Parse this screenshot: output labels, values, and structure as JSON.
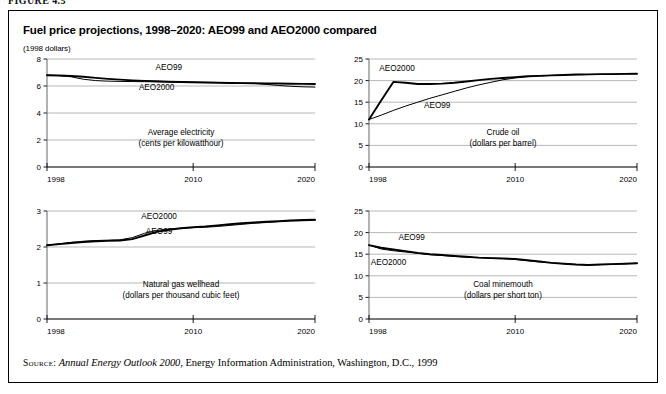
{
  "figure": {
    "label": "FIGURE 4.5"
  },
  "panel": {
    "title": "Fuel price projections, 1998–2020: AEO99 and AEO2000 compared",
    "units": "(1998 dollars)"
  },
  "source": {
    "kicker": "Source:",
    "italic_part": "Annual Energy Outlook 2000",
    "rest": ", Energy Information Administration, Washington, D.C., 1999"
  },
  "series_names": {
    "aeo99": "AEO99",
    "aeo2000": "AEO2000"
  },
  "chart_data": [
    {
      "id": "electricity",
      "type": "line",
      "title": "Average electricity",
      "subtitle": "(cents per kilowatthour)",
      "xlabel": "",
      "ylabel": "",
      "xlim": [
        1998,
        2020
      ],
      "ylim": [
        0,
        8
      ],
      "yticks": [
        0,
        2,
        4,
        6,
        8
      ],
      "xticks": [
        1998,
        2010,
        2020
      ],
      "xtick_labels": [
        "1998",
        "2010",
        "2020"
      ],
      "ytick_labels": [
        "0",
        "2",
        "4",
        "6",
        "8"
      ],
      "grid": true,
      "legend": "inline-labels",
      "x": [
        1998,
        1999,
        2000,
        2001,
        2002,
        2003,
        2004,
        2005,
        2006,
        2007,
        2008,
        2009,
        2010,
        2011,
        2012,
        2013,
        2014,
        2015,
        2016,
        2017,
        2018,
        2019,
        2020
      ],
      "series": [
        {
          "name": "AEO99",
          "label_x": 2008,
          "label_y": 7.15,
          "values": [
            6.8,
            6.78,
            6.74,
            6.68,
            6.6,
            6.53,
            6.47,
            6.42,
            6.38,
            6.35,
            6.32,
            6.3,
            6.28,
            6.26,
            6.24,
            6.22,
            6.21,
            6.2,
            6.19,
            6.18,
            6.17,
            6.16,
            6.15
          ]
        },
        {
          "name": "AEO2000",
          "label_x": 2007,
          "label_y": 5.72,
          "values": [
            6.8,
            6.77,
            6.68,
            6.5,
            6.4,
            6.36,
            6.34,
            6.33,
            6.32,
            6.31,
            6.3,
            6.29,
            6.28,
            6.27,
            6.26,
            6.24,
            6.22,
            6.19,
            6.12,
            6.04,
            5.98,
            5.94,
            5.92
          ]
        }
      ]
    },
    {
      "id": "crude-oil",
      "type": "line",
      "title": "Crude oil",
      "subtitle": "(dollars per barrel)",
      "xlabel": "",
      "ylabel": "",
      "xlim": [
        1998,
        2020
      ],
      "ylim": [
        0,
        25
      ],
      "yticks": [
        0,
        5,
        10,
        15,
        20,
        25
      ],
      "xticks": [
        1998,
        2010,
        2020
      ],
      "xtick_labels": [
        "1998",
        "2010",
        "2020"
      ],
      "ytick_labels": [
        "0",
        "5",
        "10",
        "15",
        "20",
        "25"
      ],
      "grid": true,
      "legend": "inline-labels",
      "x": [
        1998,
        1999,
        2000,
        2001,
        2002,
        2003,
        2004,
        2005,
        2006,
        2007,
        2008,
        2009,
        2010,
        2011,
        2012,
        2013,
        2014,
        2015,
        2016,
        2017,
        2018,
        2019,
        2020
      ],
      "series": [
        {
          "name": "AEO2000",
          "label_x": 2000.3,
          "label_y": 22.3,
          "values": [
            11.0,
            15.4,
            19.7,
            19.5,
            19.2,
            19.2,
            19.3,
            19.5,
            19.8,
            20.1,
            20.4,
            20.6,
            20.8,
            21.0,
            21.1,
            21.2,
            21.3,
            21.4,
            21.45,
            21.5,
            21.5,
            21.55,
            21.6
          ]
        },
        {
          "name": "AEO99",
          "label_x": 2003.6,
          "label_y": 13.6,
          "values": [
            11.0,
            12.0,
            13.1,
            14.1,
            15.0,
            15.9,
            16.7,
            17.5,
            18.3,
            19.0,
            19.6,
            20.2,
            20.6,
            20.9,
            21.1,
            21.2,
            21.3,
            21.35,
            21.4,
            21.45,
            21.5,
            21.55,
            21.6
          ]
        }
      ]
    },
    {
      "id": "natural-gas",
      "type": "line",
      "title": "Natural gas wellhead",
      "subtitle": "(dollars per thousand cubic feet)",
      "xlabel": "",
      "ylabel": "",
      "xlim": [
        1998,
        2020
      ],
      "ylim": [
        0,
        3
      ],
      "yticks": [
        0,
        1,
        2,
        3
      ],
      "xticks": [
        1998,
        2010,
        2020
      ],
      "xtick_labels": [
        "1998",
        "2010",
        "2020"
      ],
      "ytick_labels": [
        "0",
        "1",
        "2",
        "3"
      ],
      "grid": true,
      "legend": "inline-labels",
      "x": [
        1998,
        1999,
        2000,
        2001,
        2002,
        2003,
        2004,
        2005,
        2006,
        2007,
        2008,
        2009,
        2010,
        2011,
        2012,
        2013,
        2014,
        2015,
        2016,
        2017,
        2018,
        2019,
        2020
      ],
      "series": [
        {
          "name": "AEO2000",
          "label_x": 2007.2,
          "label_y": 2.78,
          "values": [
            2.05,
            2.08,
            2.11,
            2.14,
            2.16,
            2.17,
            2.18,
            2.22,
            2.32,
            2.42,
            2.48,
            2.52,
            2.55,
            2.57,
            2.6,
            2.63,
            2.66,
            2.68,
            2.7,
            2.72,
            2.74,
            2.75,
            2.76
          ]
        },
        {
          "name": "AEO99",
          "label_x": 2007.2,
          "label_y": 2.36,
          "values": [
            2.05,
            2.09,
            2.13,
            2.16,
            2.18,
            2.19,
            2.2,
            2.26,
            2.38,
            2.46,
            2.5,
            2.52,
            2.54,
            2.55,
            2.57,
            2.6,
            2.63,
            2.66,
            2.68,
            2.7,
            2.72,
            2.73,
            2.74
          ]
        }
      ]
    },
    {
      "id": "coal",
      "type": "line",
      "title": "Coal minemouth",
      "subtitle": "(dollars per short ton)",
      "xlabel": "",
      "ylabel": "",
      "xlim": [
        1998,
        2020
      ],
      "ylim": [
        0,
        25
      ],
      "yticks": [
        0,
        5,
        10,
        15,
        20,
        25
      ],
      "xticks": [
        1998,
        2010,
        2020
      ],
      "xtick_labels": [
        "1998",
        "2010",
        "2020"
      ],
      "ytick_labels": [
        "0",
        "5",
        "10",
        "15",
        "20",
        "25"
      ],
      "grid": true,
      "legend": "inline-labels",
      "x": [
        1998,
        1999,
        2000,
        2001,
        2002,
        2003,
        2004,
        2005,
        2006,
        2007,
        2008,
        2009,
        2010,
        2011,
        2012,
        2013,
        2014,
        2015,
        2016,
        2017,
        2018,
        2019,
        2020
      ],
      "series": [
        {
          "name": "AEO99",
          "label_x": 2001.5,
          "label_y": 18.3,
          "values": [
            17.1,
            16.5,
            16.1,
            15.7,
            15.3,
            15.0,
            14.8,
            14.6,
            14.4,
            14.2,
            14.1,
            14.0,
            13.9,
            13.6,
            13.3,
            13.0,
            12.8,
            12.6,
            12.5,
            12.6,
            12.7,
            12.8,
            12.9
          ]
        },
        {
          "name": "AEO2000",
          "label_x": 1999.6,
          "label_y": 12.5,
          "values": [
            17.1,
            16.2,
            15.8,
            15.5,
            15.2,
            14.9,
            14.7,
            14.5,
            14.3,
            14.2,
            14.1,
            14.0,
            13.8,
            13.5,
            13.2,
            13.0,
            12.8,
            12.6,
            12.5,
            12.6,
            12.7,
            12.8,
            12.9
          ]
        }
      ]
    }
  ]
}
